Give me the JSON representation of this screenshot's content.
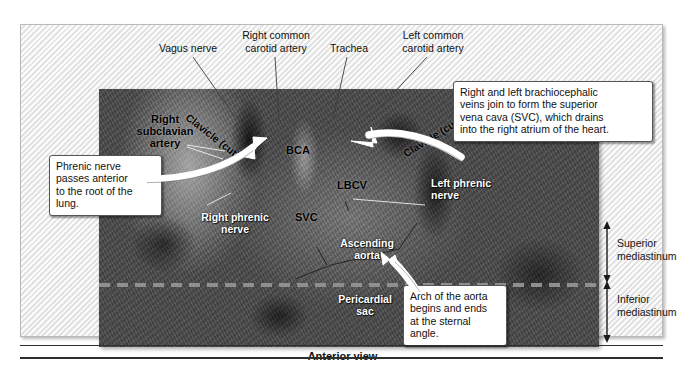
{
  "figure": {
    "caption": "Anterior view",
    "photo_alt_name": "superior-mediastinum-dissection-photograph"
  },
  "top_labels": [
    {
      "id": "vagus-nerve",
      "text": "Vagus nerve"
    },
    {
      "id": "right-common-carotid-artery",
      "text": "Right common\ncarotid artery"
    },
    {
      "id": "trachea",
      "text": "Trachea"
    },
    {
      "id": "left-common-carotid-artery",
      "text": "Left common\ncarotid artery"
    }
  ],
  "photo_labels": {
    "right_subclavian_artery": "Right\nsubclavian\nartery",
    "clavicle_cut_left": "Clavicle (cut)",
    "clavicle_cut_right": "Clavicle (cut)",
    "bca": "BCA",
    "lbcv": "LBCV",
    "svc": "SVC",
    "right_phrenic_nerve": "Right phrenic\nnerve",
    "left_phrenic_nerve": "Left phrenic\nnerve",
    "ascending_aorta": "Ascending\naorta",
    "pericardial_sac": "Pericardial\nsac"
  },
  "callouts": {
    "phrenic_nerve": "Phrenic nerve\npasses anterior\nto the root of the\nlung.",
    "brachiocephalic_veins": "Right and left brachiocephalic\nveins join to form the superior\nvena cava (SVC), which drains\ninto the right atrium of the heart.",
    "aortic_arch": "Arch of the aorta\nbegins and ends\nat the sternal\nangle."
  },
  "mediastinum": {
    "superior": "Superior\nmediastinum",
    "inferior": "Inferior\nmediastinum"
  },
  "colors": {
    "frame_background": "#ededed",
    "frame_border": "#b9b9b9",
    "callout_border": "#555555",
    "label_text": "#111111",
    "white_label_text": "#ffffff",
    "divider_dash": "#8f8f8f",
    "rule": "#2e2e2e"
  }
}
